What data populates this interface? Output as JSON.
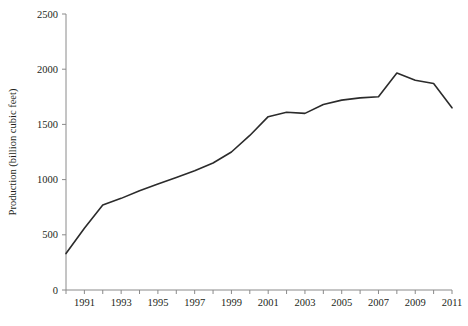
{
  "chart_data": {
    "type": "line",
    "title": "",
    "xlabel": "",
    "ylabel": "Production (billion cubic feet)",
    "xlim": [
      1990,
      2011
    ],
    "ylim": [
      0,
      2500
    ],
    "grid": false,
    "legend": null,
    "series_color": "#2b2b2b",
    "x": [
      1990,
      1991,
      1992,
      1993,
      1994,
      1995,
      1996,
      1997,
      1998,
      1999,
      2000,
      2001,
      2002,
      2003,
      2004,
      2005,
      2006,
      2007,
      2008,
      2009,
      2010,
      2011
    ],
    "values": [
      330,
      560,
      770,
      830,
      900,
      960,
      1020,
      1080,
      1150,
      1250,
      1400,
      1570,
      1610,
      1600,
      1680,
      1720,
      1740,
      1750,
      1965,
      1900,
      1870,
      1650
    ],
    "series": [
      {
        "name": "Production",
        "values": [
          330,
          560,
          770,
          830,
          900,
          960,
          1020,
          1080,
          1150,
          1250,
          1400,
          1570,
          1610,
          1600,
          1680,
          1720,
          1740,
          1750,
          1965,
          1900,
          1870,
          1650
        ]
      }
    ],
    "x_tick_labels": [
      "1991",
      "1993",
      "1995",
      "1997",
      "1999",
      "2001",
      "2003",
      "2005",
      "2007",
      "2009",
      "2011"
    ],
    "x_tick_values": [
      1991,
      1993,
      1995,
      1997,
      1999,
      2001,
      2003,
      2005,
      2007,
      2009,
      2011
    ],
    "x_minor_tick_values": [
      1990,
      1992,
      1994,
      1996,
      1998,
      2000,
      2002,
      2004,
      2006,
      2008,
      2010
    ],
    "y_tick_labels": [
      "0",
      "500",
      "1000",
      "1500",
      "2000",
      "2500"
    ],
    "y_tick_values": [
      0,
      500,
      1000,
      1500,
      2000,
      2500
    ]
  }
}
